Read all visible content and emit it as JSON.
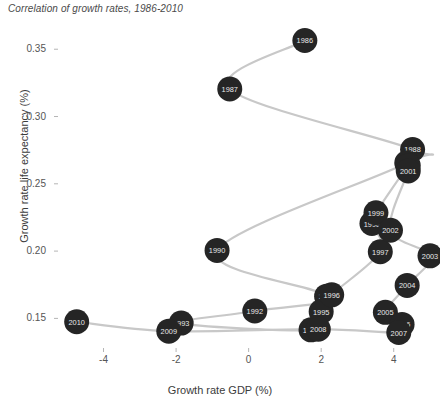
{
  "chart_data": {
    "type": "scatter",
    "title": "Correlation of growth rates, 1986-2010",
    "xlabel": "Growth rate GDP (%)",
    "ylabel": "Growth rate life expectancy (%)",
    "xlim": [
      -5.2,
      5.0
    ],
    "ylim": [
      0.128,
      0.368
    ],
    "xticks": [
      -4,
      -2,
      0,
      2,
      4
    ],
    "xtick_labels": [
      "-4",
      "-2",
      "0",
      "2",
      "4"
    ],
    "yticks": [
      0.15,
      0.2,
      0.25,
      0.3,
      0.35
    ],
    "ytick_labels": [
      "0.15",
      "0.20",
      "0.25",
      "0.30",
      "0.35"
    ],
    "grid": false,
    "legend": "none",
    "connected": true,
    "marker_color": "#252525",
    "line_color": "#c8c8c8",
    "label_color": "#e8e8e8",
    "point_label_key": "year",
    "points": [
      {
        "year": "1986",
        "x": 1.55,
        "y": 0.3565
      },
      {
        "year": "1987",
        "x": -0.52,
        "y": 0.3205
      },
      {
        "year": "1988",
        "x": 4.52,
        "y": 0.2755
      },
      {
        "year": "1989",
        "x": 4.36,
        "y": 0.2655
      },
      {
        "year": "1990",
        "x": -0.87,
        "y": 0.2005
      },
      {
        "year": "1991",
        "x": 2.15,
        "y": 0.1665
      },
      {
        "year": "1992",
        "x": 0.17,
        "y": 0.1555
      },
      {
        "year": "1993",
        "x": -1.86,
        "y": 0.1465
      },
      {
        "year": "1994",
        "x": 1.72,
        "y": 0.1415
      },
      {
        "year": "1995",
        "x": 2.0,
        "y": 0.155
      },
      {
        "year": "1996",
        "x": 2.29,
        "y": 0.1675
      },
      {
        "year": "1997",
        "x": 3.63,
        "y": 0.1995
      },
      {
        "year": "1998",
        "x": 3.4,
        "y": 0.2205
      },
      {
        "year": "1999",
        "x": 3.51,
        "y": 0.2285
      },
      {
        "year": "2000",
        "x": 4.4,
        "y": 0.2635
      },
      {
        "year": "2001",
        "x": 4.4,
        "y": 0.2595
      },
      {
        "year": "2002",
        "x": 3.91,
        "y": 0.2155
      },
      {
        "year": "2003",
        "x": 5.0,
        "y": 0.1965
      },
      {
        "year": "2004",
        "x": 4.37,
        "y": 0.1745
      },
      {
        "year": "2005",
        "x": 3.77,
        "y": 0.1545
      },
      {
        "year": "2006",
        "x": 4.23,
        "y": 0.1455
      },
      {
        "year": "2007",
        "x": 4.14,
        "y": 0.1395
      },
      {
        "year": "2008",
        "x": 1.92,
        "y": 0.142
      },
      {
        "year": "2009",
        "x": -2.2,
        "y": 0.1405
      },
      {
        "year": "2010",
        "x": -4.74,
        "y": 0.1475
      }
    ]
  }
}
